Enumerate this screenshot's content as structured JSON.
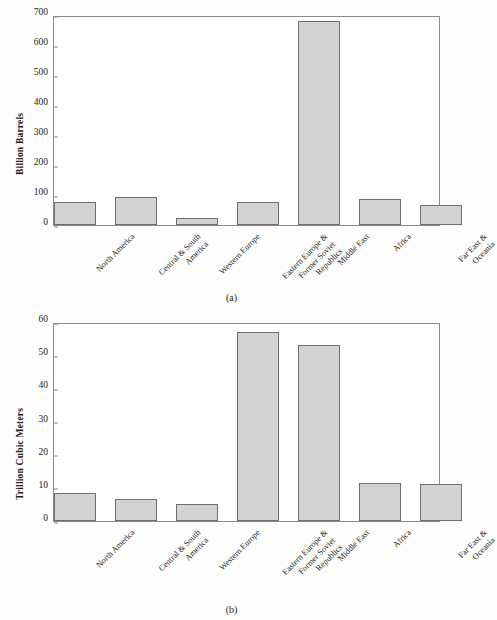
{
  "figure": {
    "background_color": "#fdfdfc",
    "bar_fill_color": "#d2d3d2",
    "bar_stroke_color": "#6f6f6f",
    "axis_color": "#8a8a8a"
  },
  "panels": [
    {
      "id": "panel-a",
      "caption": "(a)",
      "chart": {
        "type": "bar",
        "title": "",
        "xlabel": "",
        "ylabel": "Billion Barrels",
        "ylim": [
          0,
          700
        ],
        "yticks": [
          0,
          100,
          200,
          300,
          400,
          500,
          600,
          700
        ],
        "ytick_labels": [
          "0",
          "100",
          "200",
          "300",
          "400",
          "500",
          "600",
          "700"
        ],
        "grid": false,
        "legend": "none",
        "categories": [
          "North America",
          "Central & South America",
          "Western Europe",
          "Eastern Europe & Former Soviet Republics",
          "Middle East",
          "Africa",
          "Far East & Oceania"
        ],
        "category_lines": [
          [
            "North America"
          ],
          [
            "Central & South",
            "America"
          ],
          [
            "Western Europe"
          ],
          [
            "Eastern Europe &",
            "Former Soviet",
            "Republics"
          ],
          [
            "Middle East"
          ],
          [
            "Africa"
          ],
          [
            "Far East &",
            "Oceania"
          ]
        ],
        "values": [
          77,
          92,
          22,
          76,
          680,
          87,
          68
        ]
      }
    },
    {
      "id": "panel-b",
      "caption": "(b)",
      "chart": {
        "type": "bar",
        "title": "",
        "xlabel": "",
        "ylabel": "Trillion Cubic Meters",
        "ylim": [
          0,
          60
        ],
        "yticks": [
          0,
          10,
          20,
          30,
          40,
          50,
          60
        ],
        "ytick_labels": [
          "0",
          "10",
          "20",
          "30",
          "40",
          "50",
          "60"
        ],
        "grid": false,
        "legend": "none",
        "categories": [
          "North America",
          "Central & South America",
          "Western Europe",
          "Eastern Europe & Former Soviet Republics",
          "Middle East",
          "Africa",
          "Far East & Oceania"
        ],
        "category_lines": [
          [
            "North America"
          ],
          [
            "Central & South",
            "America"
          ],
          [
            "Western Europe"
          ],
          [
            "Eastern Europe &",
            "Former Soviet",
            "Republics"
          ],
          [
            "Middle East"
          ],
          [
            "Africa"
          ],
          [
            "Far East &",
            "Oceania"
          ]
        ],
        "values": [
          8.4,
          6.7,
          5.0,
          57.0,
          53.0,
          11.6,
          11.2
        ]
      }
    }
  ],
  "chart_data": [
    {
      "type": "bar",
      "panel": "(a)",
      "title": "",
      "xlabel": "",
      "ylabel": "Billion Barrels",
      "ylim": [
        0,
        700
      ],
      "yticks": [
        0,
        100,
        200,
        300,
        400,
        500,
        600,
        700
      ],
      "grid": false,
      "legend": "none",
      "categories": [
        "North America",
        "Central & South America",
        "Western Europe",
        "Eastern Europe & Former Soviet Republics",
        "Middle East",
        "Africa",
        "Far East & Oceania"
      ],
      "values": [
        77,
        92,
        22,
        76,
        680,
        87,
        68
      ]
    },
    {
      "type": "bar",
      "panel": "(b)",
      "title": "",
      "xlabel": "",
      "ylabel": "Trillion Cubic Meters",
      "ylim": [
        0,
        60
      ],
      "yticks": [
        0,
        10,
        20,
        30,
        40,
        50,
        60
      ],
      "grid": false,
      "legend": "none",
      "categories": [
        "North America",
        "Central & South America",
        "Western Europe",
        "Eastern Europe & Former Soviet Republics",
        "Middle East",
        "Africa",
        "Far East & Oceania"
      ],
      "values": [
        8.4,
        6.7,
        5.0,
        57.0,
        53.0,
        11.6,
        11.2
      ]
    }
  ]
}
